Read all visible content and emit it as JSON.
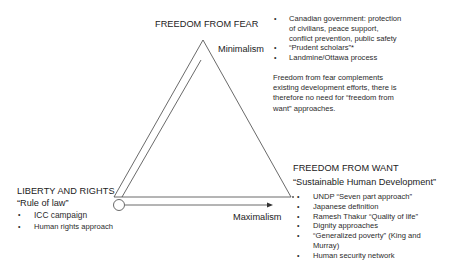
{
  "diagram": {
    "top_node": {
      "title": "FREEDOM FROM FEAR",
      "label": "Minimalism",
      "bullets": [
        "Canadian government: protection",
        "of civilians, peace support,",
        "conflict prevention, public safety",
        "“Prudent scholars”*",
        "Landmine/Ottawa process"
      ],
      "bullet_flags": [
        true,
        false,
        false,
        true,
        true
      ],
      "note": "Freedom from fear complements existing development efforts, there is therefore no need for “freedom from want” approaches."
    },
    "left_node": {
      "title": "LIBERTY AND RIGHTS",
      "subtitle": "“Rule of law”",
      "bullets": [
        "ICC campaign",
        "Human rights approach"
      ]
    },
    "right_node": {
      "title": "FREEDOM FROM WANT",
      "subtitle": "“Sustainable Human Development”",
      "bullets": [
        "UNDP “Seven part approach”",
        "Japanese definition",
        "Ramesh Thakur “Quality of life”",
        "Dignity approaches",
        "“Generalized poverty” (King and",
        "Murray)",
        "Human security network"
      ],
      "bullet_flags": [
        true,
        true,
        true,
        true,
        true,
        false,
        true
      ]
    },
    "axis": {
      "label": "Maximalism"
    },
    "bullet_glyph": "•"
  }
}
